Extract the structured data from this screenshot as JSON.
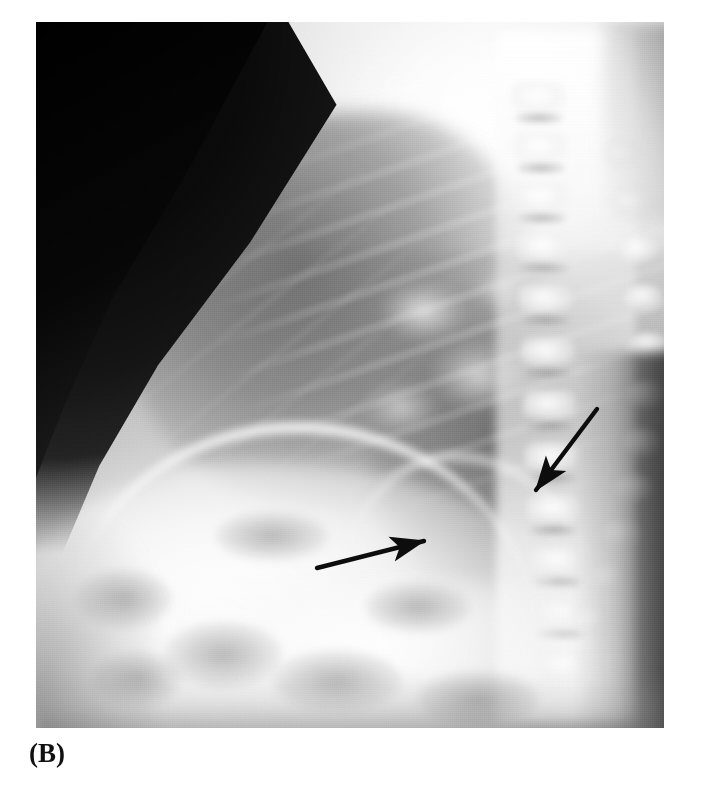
{
  "figure": {
    "panel_label": "(B)",
    "modality": "radiograph",
    "view": "lateral chest",
    "background_color": "#ffffff",
    "frame": {
      "x": 36,
      "y": 22,
      "width": 628,
      "height": 706
    }
  },
  "image_regions": [
    {
      "name": "air-corner",
      "label": "dark exposed film / air, upper-left triangle",
      "tone": "#070707"
    },
    {
      "name": "sternal-rim",
      "label": "bright anterior chest wall / sternal rim",
      "tone": "#f2f2f2"
    },
    {
      "name": "anterior-lung",
      "label": "retrosternal clear space (darker lung)",
      "tone": "#6e6e6e"
    },
    {
      "name": "posterior-lung",
      "label": "posterior costophrenic lung field",
      "tone": "#707070"
    },
    {
      "name": "upper-thorax",
      "label": "overexposed upper thorax / shoulder girdle",
      "tone": "#fdfdfd"
    },
    {
      "name": "hilum",
      "label": "perihilar soft-tissue densities",
      "tone": "#e6e6e6"
    },
    {
      "name": "diaphragm",
      "label": "hemidiaphragm contour",
      "tone": "#fafafa"
    },
    {
      "name": "abdomen",
      "label": "sub-diaphragmatic abdomen / liver",
      "tone": "#f7f7f7"
    },
    {
      "name": "spine",
      "label": "thoracic vertebral column with posterior elements",
      "tone": "#f0f0f0"
    },
    {
      "name": "posterior-soft-tissue",
      "label": "posterior back soft tissue (dark band)",
      "tone": "#1e1e1e"
    }
  ],
  "annotations": {
    "arrow_color": "#0d0d0d",
    "arrows": [
      {
        "name": "arrow-lower-left",
        "direction": "points up-right",
        "tail": {
          "x": 281,
          "y": 546
        },
        "tip": {
          "x": 388,
          "y": 519
        },
        "label": "arrow indicating retrocardiac / posterior basal abnormality"
      },
      {
        "name": "arrow-upper-right",
        "direction": "points down-left",
        "tail": {
          "x": 561,
          "y": 387
        },
        "tip": {
          "x": 500,
          "y": 468
        },
        "label": "arrow indicating posterior paravertebral abnormality"
      }
    ]
  },
  "vertebrae": [
    {
      "x": 476,
      "y": 60
    },
    {
      "x": 478,
      "y": 110
    },
    {
      "x": 479,
      "y": 160
    },
    {
      "x": 481,
      "y": 210
    },
    {
      "x": 483,
      "y": 262
    },
    {
      "x": 485,
      "y": 315
    },
    {
      "x": 487,
      "y": 368
    },
    {
      "x": 489,
      "y": 420
    },
    {
      "x": 491,
      "y": 472
    },
    {
      "x": 494,
      "y": 524
    },
    {
      "x": 497,
      "y": 576
    },
    {
      "x": 500,
      "y": 628
    }
  ],
  "rib_heads": [
    {
      "x": 566,
      "y": 118
    },
    {
      "x": 574,
      "y": 166
    },
    {
      "x": 582,
      "y": 214
    },
    {
      "x": 588,
      "y": 262
    },
    {
      "x": 592,
      "y": 310
    },
    {
      "x": 590,
      "y": 358
    },
    {
      "x": 586,
      "y": 406
    },
    {
      "x": 578,
      "y": 452
    },
    {
      "x": 566,
      "y": 498
    },
    {
      "x": 552,
      "y": 542
    },
    {
      "x": 536,
      "y": 584
    }
  ],
  "gas_shadows": [
    {
      "x": 40,
      "y": 548,
      "w": 96,
      "h": 58
    },
    {
      "x": 128,
      "y": 600,
      "w": 118,
      "h": 66
    },
    {
      "x": 56,
      "y": 630,
      "w": 90,
      "h": 54
    },
    {
      "x": 236,
      "y": 628,
      "w": 130,
      "h": 62
    },
    {
      "x": 330,
      "y": 560,
      "w": 104,
      "h": 50
    },
    {
      "x": 180,
      "y": 490,
      "w": 112,
      "h": 48
    },
    {
      "x": 382,
      "y": 650,
      "w": 120,
      "h": 56
    }
  ]
}
